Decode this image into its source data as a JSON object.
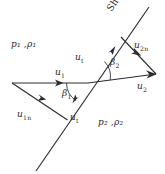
{
  "diagram": {
    "stroke_color": "#2c2c31",
    "text_color": "#28282c",
    "background": "#ffffff",
    "shock_label": "Shock wave",
    "regions": {
      "upstream": {
        "pressure": "p",
        "density": "ρ",
        "sub": "1",
        "text": "p₁ ,ρ₁"
      },
      "downstream": {
        "pressure": "p",
        "density": "ρ",
        "sub": "2",
        "text": "p₂ ,ρ₂"
      }
    },
    "vectors": [
      {
        "id": "u1",
        "symbol": "u",
        "sub": "1",
        "desc": "upstream-velocity"
      },
      {
        "id": "u1n",
        "symbol": "u",
        "sub": "1n",
        "desc": "upstream-normal-component"
      },
      {
        "id": "ut-upper",
        "symbol": "u",
        "sub": "t",
        "desc": "tangential-component-upper"
      },
      {
        "id": "ut-lower",
        "symbol": "u",
        "sub": "t",
        "desc": "tangential-component-lower"
      },
      {
        "id": "u2n",
        "symbol": "u",
        "sub": "2n",
        "desc": "downstream-normal-component"
      },
      {
        "id": "u2",
        "symbol": "u",
        "sub": "2",
        "desc": "downstream-velocity"
      }
    ],
    "angles": [
      {
        "id": "beta1",
        "symbol": "β",
        "sub": "1",
        "desc": "shock-wave-angle"
      },
      {
        "id": "beta2",
        "symbol": "β",
        "sub": "2",
        "desc": "downstream-flow-angle"
      }
    ]
  }
}
